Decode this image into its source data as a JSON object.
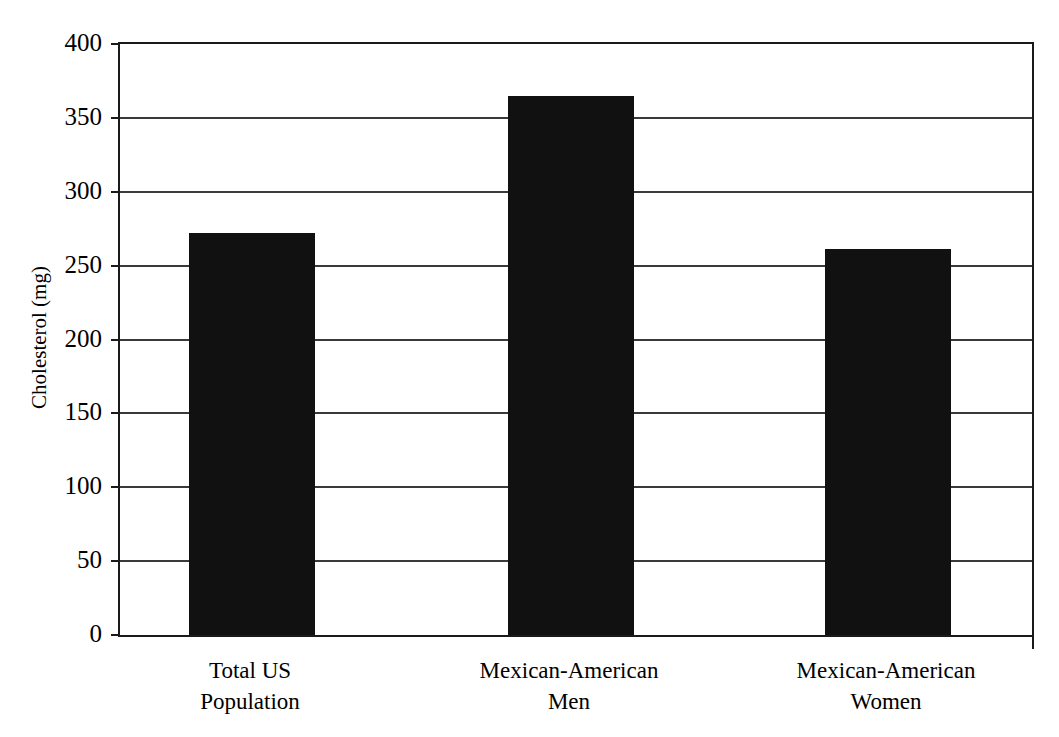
{
  "chart_data": {
    "type": "bar",
    "title": "",
    "xlabel": "",
    "ylabel": "Cholesterol (mg)",
    "categories": [
      "Total US\nPopulation",
      "Mexican-American\nMen",
      "Mexican-American\nWomen"
    ],
    "values": [
      272,
      365,
      261
    ],
    "ylim": [
      0,
      400
    ],
    "yticks": [
      0,
      50,
      100,
      150,
      200,
      250,
      300,
      350,
      400
    ],
    "ytick_labels": [
      "0",
      "50",
      "100",
      "150",
      "200",
      "250",
      "300",
      "350",
      "400"
    ],
    "grid": true,
    "grid_axis": "y",
    "legend": false,
    "bar_color": "#111111",
    "axis_color": "#1a1a1a",
    "background": "#ffffff"
  },
  "axis": {
    "y_title": "Cholesterol (mg)",
    "ticks": [
      {
        "value": 400,
        "label": "400"
      },
      {
        "value": 350,
        "label": "350"
      },
      {
        "value": 300,
        "label": "300"
      },
      {
        "value": 250,
        "label": "250"
      },
      {
        "value": 200,
        "label": "200"
      },
      {
        "value": 150,
        "label": "150"
      },
      {
        "value": 100,
        "label": "100"
      },
      {
        "value": 50,
        "label": "50"
      },
      {
        "value": 0,
        "label": "0"
      }
    ]
  },
  "categories": [
    {
      "line1": "Total US",
      "line2": "Population",
      "value": 272
    },
    {
      "line1": "Mexican-American",
      "line2": "Men",
      "value": 365
    },
    {
      "line1": "Mexican-American",
      "line2": "Women",
      "value": 261
    }
  ]
}
